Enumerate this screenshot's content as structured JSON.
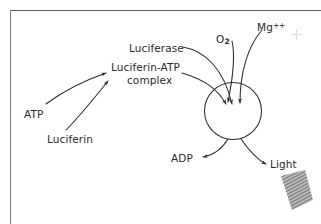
{
  "figure": {
    "line_color": "#2b2b2b",
    "text_color": "#2b2b2b",
    "background": "#ffffff",
    "frame_color": "#5a5a5a"
  },
  "labels": {
    "luciferase": "Luciferase",
    "complex_line1": "Luciferin-ATP",
    "complex_line2": "complex",
    "oxygen_symbol": "O",
    "oxygen_subscript": "2",
    "magnesium_symbol": "Mg",
    "magnesium_superscript": "++",
    "atp": "ATP",
    "luciferin": "Luciferin",
    "adp": "ADP",
    "light": "Light"
  },
  "reaction": {
    "inputs_to_complex": [
      "ATP",
      "Luciferin"
    ],
    "inputs_to_reaction_site": [
      "Luciferase",
      "Luciferin-ATP complex",
      "O2",
      "Mg++"
    ],
    "outputs": [
      "ADP",
      "Light"
    ],
    "reaction_site_shape": "circle",
    "light_emission_glyph": "hatched-scribble"
  }
}
